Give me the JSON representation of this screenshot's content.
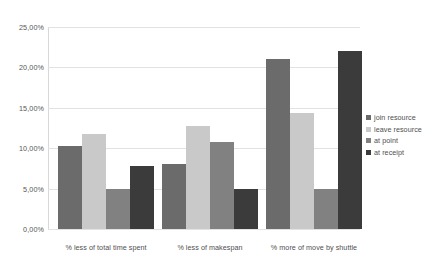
{
  "chart_data": {
    "type": "bar",
    "title": "",
    "xlabel": "",
    "ylabel": "",
    "grid": true,
    "legend_position": "right",
    "ylim": [
      0,
      25
    ],
    "ytick_values": [
      0,
      5,
      10,
      15,
      20,
      25
    ],
    "ytick_labels": [
      "0,00%",
      "5,00%",
      "10,00%",
      "15,00%",
      "20,00%",
      "25,00%"
    ],
    "categories": [
      "% less of total time spent",
      "% less of makespan",
      "% more of move by shuttle"
    ],
    "series": [
      {
        "name": "join resource",
        "color": "#6b6b6b",
        "values": [
          10.3,
          8.0,
          21.1
        ]
      },
      {
        "name": "leave resource",
        "color": "#c9c9c9",
        "values": [
          11.7,
          12.7,
          14.4
        ]
      },
      {
        "name": "at point",
        "color": "#818181",
        "values": [
          5.0,
          10.8,
          5.0
        ]
      },
      {
        "name": "at receipt",
        "color": "#3b3b3b",
        "values": [
          7.8,
          5.0,
          22.0
        ]
      }
    ]
  }
}
